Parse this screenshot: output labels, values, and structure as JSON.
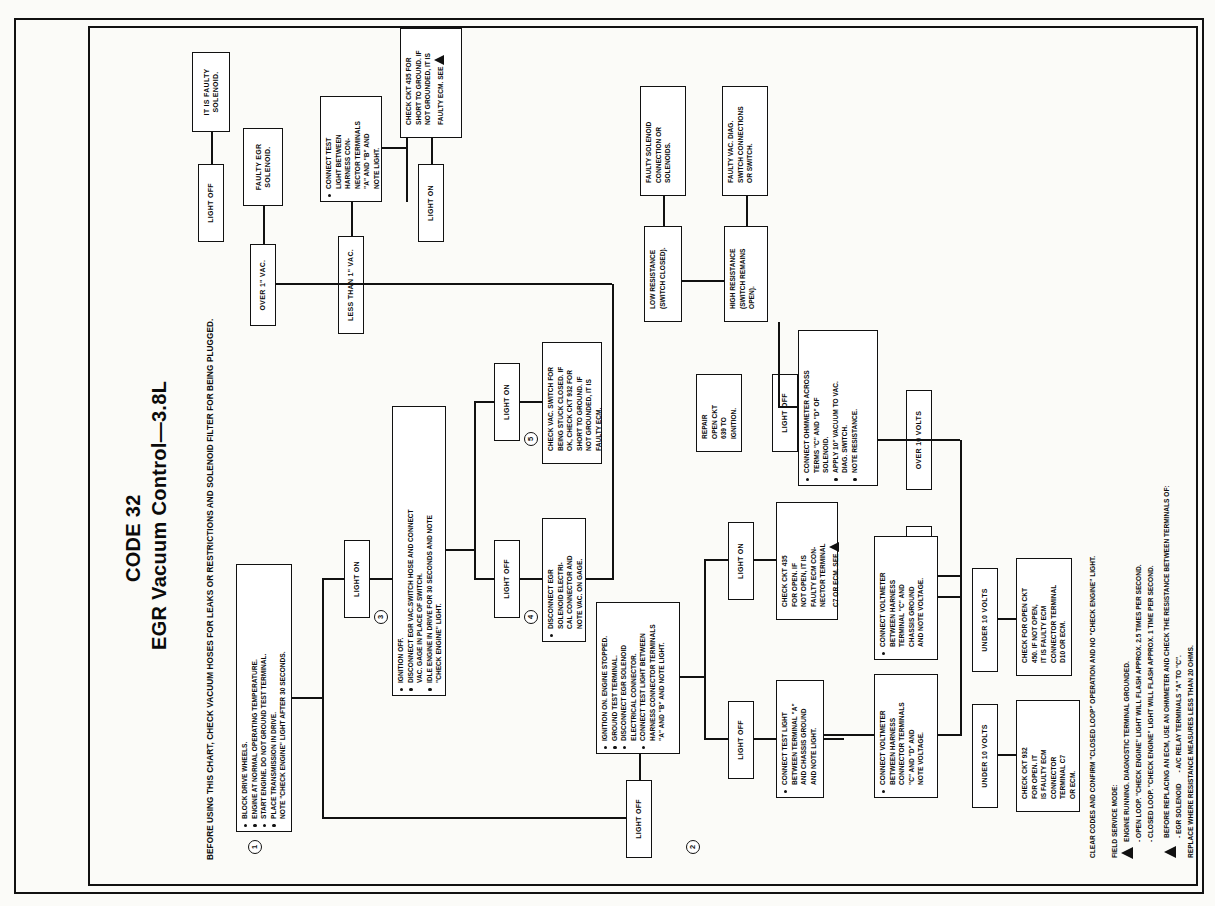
{
  "document": {
    "code_title": "CODE 32",
    "subtitle": "EGR Vacuum Control—3.8L",
    "intro": "BEFORE USING THIS CHART, CHECK VACUUM HOSES FOR LEAKS OR RESTRICTIONS AND SOLENOID FILTER FOR BEING PLUGGED."
  },
  "steps": {
    "s1": "1",
    "s2": "2",
    "s3": "3",
    "s4": "4",
    "s5": "5"
  },
  "boxes": {
    "b1": {
      "name": "step-1-preconditions",
      "lines": [
        "BLOCK DRIVE WHEELS.",
        "ENGINE AT NORMAL OPERATING TEMPERATURE.",
        "START ENGINE. DO NOT GROUND TEST TERMINAL.",
        "PLACE TRANSMISSION IN DRIVE.",
        "NOTE \"CHECK ENGINE\" LIGHT AFTER 30 SECONDS."
      ],
      "bullets": [
        true,
        true,
        true,
        true,
        false
      ]
    },
    "b2": {
      "name": "step-2-ignition-on",
      "lines": [
        "IGNITION ON. ENGINE STOPPED.",
        "GROUND TEST TERMINAL.",
        "DISCONNECT EGR SOLENOID",
        "ELECTRICAL CONNECTOR.",
        "CONNECT TEST LIGHT BETWEEN",
        "HARNESS CONNECTOR TERMINALS",
        "\"A\" AND \"B\" AND NOTE LIGHT."
      ],
      "bullets": [
        true,
        true,
        true,
        false,
        true,
        false,
        false
      ]
    },
    "b3": {
      "name": "step-3-ignition-off-vac-switch",
      "lines": [
        "IGNITION OFF.",
        "DISCONNECT EGR VAC.SWITCH HOSE AND CONNECT",
        "VAC. GAGE IN PLACE OF SWITCH.",
        "IDLE ENGINE IN DRIVE FOR 30 SECONDS AND NOTE",
        "\"CHECK ENGINE\" LIGHT."
      ],
      "bullets": [
        true,
        true,
        false,
        true,
        false
      ]
    },
    "b4": {
      "name": "disconnect-egr-solenoid-electrical",
      "lines": [
        "DISCONNECT EGR",
        "SOLENOID ELECTRI-",
        "CAL CONNECTOR AND",
        "NOTE VAC. ON GAGE."
      ],
      "bullets": [
        true,
        false,
        false,
        false
      ]
    },
    "b5": {
      "name": "check-vac-switch-stuck-closed",
      "lines": [
        "CHECK VAC. SWITCH FOR",
        "BEING STUCK CLOSED. IF",
        "OK, CHECK CKT 932 FOR",
        "SHORT TO GROUND. IF",
        "NOT GROUNDED, IT IS",
        "FAULTY ECM."
      ],
      "bullets": [
        false,
        false,
        false,
        false,
        false,
        false
      ]
    },
    "b6": {
      "name": "connect-test-light-harness",
      "lines": [
        "CONNECT TEST",
        "LIGHT BETWEEN",
        "HARNESS CON-",
        "NECTOR TERMINALS",
        "\"A\" AND \"B\" AND",
        "NOTE LIGHT."
      ],
      "bullets": [
        true,
        false,
        false,
        false,
        false,
        false
      ]
    },
    "b7": {
      "name": "check-ckt-435-short-to-ground",
      "lines": [
        "CHECK CKT 435 FOR",
        "SHORT TO GROUND. IF",
        "NOT GROUNDED, IT IS",
        "FAULTY ECM.  SEE"
      ],
      "bullets": [
        false,
        false,
        false,
        false
      ],
      "triangle": true
    },
    "b8": {
      "name": "faulty-egr-solenoid",
      "lines": [
        "FAULTY EGR",
        "SOLENOID."
      ],
      "bullets": [
        false,
        false
      ]
    },
    "b9": {
      "name": "it-is-faulty-solenoid",
      "lines": [
        "IT IS FAULTY",
        "SOLENOID."
      ],
      "bullets": [
        false,
        false
      ]
    },
    "b10": {
      "name": "connect-test-light-terminal-a",
      "lines": [
        "CONNECT TEST LIGHT",
        "BETWEEN TERMINAL \"A\"",
        "AND CHASSIS GROUND",
        "AND NOTE LIGHT."
      ],
      "bullets": [
        true,
        false,
        false,
        false
      ]
    },
    "b11": {
      "name": "repair-open-ckt-639",
      "lines": [
        "REPAIR",
        "OPEN CKT",
        "639 TO",
        "IGNITION."
      ],
      "bullets": [
        false,
        false,
        false,
        false
      ]
    },
    "b12": {
      "name": "check-ckt-435-open",
      "lines": [
        "CHECK CKT 435",
        "FOR OPEN.  IF",
        "NOT OPEN, IT IS",
        "FAULTY ECM CON-",
        "NECTOR TERMINAL",
        "C7 OR ECM. SEE"
      ],
      "bullets": [
        false,
        false,
        false,
        false,
        false,
        false
      ],
      "triangle": true
    },
    "b13": {
      "name": "connect-ohmmeter-access-terminals",
      "lines": [
        "CONNECT OHMMETER ACROSS",
        "TERMS \"C\" AND \"D\" OF",
        "SOLENOID.",
        "APPLY 10\" VACUUM TO VAC.",
        "DIAG. SWITCH.",
        "NOTE RESISTANCE."
      ],
      "bullets": [
        true,
        false,
        false,
        true,
        false,
        true
      ]
    },
    "b14": {
      "name": "high-resistance-switch-open",
      "lines": [
        "HIGH RESISTANCE",
        "(SWITCH REMAINS",
        "OPEN)."
      ],
      "bullets": [
        false,
        false,
        false
      ]
    },
    "b15": {
      "name": "low-resistance-switch-closed",
      "lines": [
        "LOW RESISTANCE",
        "(SWITCH CLOSED)."
      ],
      "bullets": [
        false,
        false
      ]
    },
    "b16": {
      "name": "faulty-vac-diag-switch-connections",
      "lines": [
        "FAULTY VAC. DIAG.",
        "SWITCH CONNECTIONS",
        "OR SWITCH."
      ],
      "bullets": [
        false,
        false,
        false
      ]
    },
    "b17": {
      "name": "faulty-solenoid-connection",
      "lines": [
        "FAULTY SOLENOID",
        "CONNECTION OR",
        "SOLENOIDS."
      ],
      "bullets": [
        false,
        false,
        false
      ]
    },
    "b18": {
      "name": "connect-voltmeter-terminals-c-d",
      "lines": [
        "CONNECT VOLTMETER",
        "BETWEEN HARNESS",
        "CONNECTOR TERMINALS",
        "\"C\" AND \"D\" AND",
        "NOTE VOLTAGE."
      ],
      "bullets": [
        true,
        false,
        false,
        false,
        false
      ]
    },
    "b19": {
      "name": "connect-voltmeter-terminal-c-ground",
      "lines": [
        "CONNECT VOLTMETER",
        "BETWEEN HARNESS",
        "TERMINAL \"C\" AND",
        "CHASSIS GROUND",
        "AND NOTE VOLTAGE."
      ],
      "bullets": [
        true,
        false,
        false,
        false,
        false
      ]
    },
    "b20": {
      "name": "check-ckt-932-open",
      "lines": [
        "CHECK CKT 932",
        "FOR OPEN. IT",
        "IS FAULTY ECM",
        "CONNECTOR",
        "TERMINAL C7",
        "OR ECM."
      ],
      "bullets": [
        false,
        false,
        false,
        false,
        false,
        false
      ]
    },
    "b21": {
      "name": "check-open-ckt-450",
      "lines": [
        "CHECK FOR OPEN CKT",
        "450. IF NOT OPEN,",
        "IT IS FAULTY ECM",
        "CONNECTOR TERMINAL",
        "D10 OR ECM."
      ],
      "bullets": [
        false,
        false,
        false,
        false,
        false
      ]
    }
  },
  "labels": {
    "light_off_1": "LIGHT OFF",
    "light_on_1": "LIGHT ON",
    "light_on_2": "LIGHT ON",
    "light_off_2": "LIGHT OFF",
    "light_on_3": "LIGHT ON",
    "light_off_3": "LIGHT OFF",
    "light_on_4": "LIGHT ON",
    "light_off_4": "LIGHT OFF",
    "light_on_5": "LIGHT ON",
    "over_1_vac": "OVER 1\" VAC.",
    "less_than_1_vac": "LESS THAN 1\" VAC.",
    "under_10_volts_1": "UNDER 10 VOLTS",
    "over_10_volts_1": "OVER 10 VOLTS",
    "under_10_volts_2": "UNDER 10 VOLTS",
    "over_10_volts_2": "OVER 10 VOLTS"
  },
  "footnotes": {
    "clear_codes": "CLEAR CODES AND CONFIRM \"CLOSED LOOP\" OPERATION AND NO \"CHECK ENGINE\" LIGHT.",
    "field_service_heading": "FIELD SERVICE MODE:",
    "field_lines": [
      "ENGINE RUNNING. DIAGNOSTIC TERMINAL GROUNDED.",
      "- OPEN LOOP. \"CHECK ENGINE\" LIGHT WILL FLASH APPROX. 2.5 TIMES PER SECOND.",
      "- CLOSED LOOP. \"CHECK ENGINE\" LIGHT WILL FLASH APPROX. 1 TIME PER SECOND."
    ],
    "warning_lines": [
      "BEFORE REPLACING AN ECM, USE AN OHMMETER AND CHECK THE RESISTANCE BETWEEN TERMINALS OF:",
      "- EGR SOLENOID      - A/C RELAY TERMINALS \"A\" TO \"C\".",
      "REPLACE WHERE RESISTANCE MEASURES LESS THAN 20 OHMS."
    ]
  }
}
